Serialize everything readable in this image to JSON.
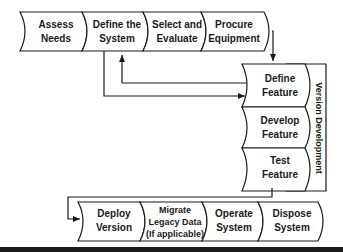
{
  "diagram": {
    "top_row": [
      {
        "line1": "Assess",
        "line2": "Needs"
      },
      {
        "line1": "Define the",
        "line2": "System"
      },
      {
        "line1": "Select and",
        "line2": "Evaluate"
      },
      {
        "line1": "Procure",
        "line2": "Equipment"
      }
    ],
    "version_development": {
      "label": "Version Development",
      "steps": [
        {
          "line1": "Define",
          "line2": "Feature"
        },
        {
          "line1": "Develop",
          "line2": "Feature"
        },
        {
          "line1": "Test",
          "line2": "Feature"
        }
      ]
    },
    "bottom_row": [
      {
        "line1": "Deploy",
        "line2": "Version"
      },
      {
        "line1": "Migrate",
        "line2": "Legacy Data",
        "line3": "(If applicable)"
      },
      {
        "line1": "Operate",
        "line2": "System"
      },
      {
        "line1": "Dispose",
        "line2": "System"
      }
    ],
    "colors": {
      "stroke": "#1a1a1a",
      "background": "#ffffff"
    }
  }
}
